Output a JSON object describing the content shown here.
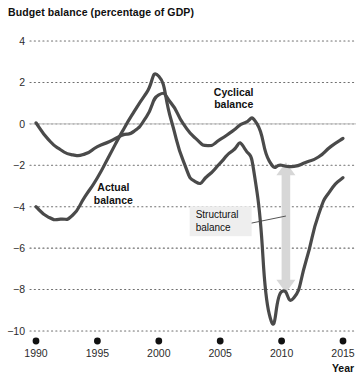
{
  "chart_data": {
    "type": "line",
    "title": "Budget balance (percentage of GDP)",
    "xlabel": "Year",
    "ylabel": "",
    "xlim": [
      1989,
      2015.6
    ],
    "ylim": [
      -10,
      4
    ],
    "grid": "horizontal-dotted",
    "zero_line": true,
    "legend_position": "inline-annotations",
    "xticks": [
      1990,
      1995,
      2000,
      2005,
      2010,
      2015
    ],
    "xtick_labels": [
      "1990",
      "1995",
      "2000",
      "2005",
      "2010",
      "2015"
    ],
    "yticks": [
      4,
      2,
      0,
      -2,
      -4,
      -6,
      -8,
      -10
    ],
    "ytick_labels": [
      "4",
      "2",
      "0",
      "−2",
      "−4",
      "−6",
      "−8",
      "−10"
    ],
    "series": [
      {
        "name": "Cyclical balance",
        "color": "#4a4a4a",
        "label_x": 2006.1,
        "label_y": 1.35,
        "x": [
          1990,
          1991,
          1992,
          1993,
          1994,
          1995,
          1996,
          1997,
          1998,
          1999,
          2000,
          2001,
          2002,
          2003,
          2004,
          2005,
          2006,
          2007,
          2008,
          2009,
          2010,
          2011,
          2012,
          2013,
          2014,
          2015
        ],
        "values": [
          0.05,
          -0.75,
          -1.25,
          -1.5,
          -1.45,
          -1.1,
          -0.85,
          -0.55,
          -0.35,
          0.35,
          1.4,
          1.0,
          0.0,
          -0.7,
          -1.05,
          -0.75,
          -0.35,
          0.05,
          0.0,
          -1.8,
          -2.0,
          -2.05,
          -1.85,
          -1.6,
          -1.1,
          -0.7
        ]
      },
      {
        "name": "Actual balance",
        "color": "#4a4a4a",
        "label_x": 1996.3,
        "label_y": -3.25,
        "x": [
          1990,
          1991,
          1992,
          1993,
          1994,
          1995,
          1996,
          1997,
          1998,
          1999,
          2000,
          2001,
          2002,
          2003,
          2004,
          2005,
          2006,
          2007,
          2008,
          2009,
          2010,
          2011,
          2012,
          2013,
          2014,
          2015
        ],
        "values": [
          -4.0,
          -4.5,
          -4.6,
          -4.4,
          -3.5,
          -2.6,
          -1.5,
          -0.4,
          0.6,
          1.5,
          2.3,
          0.2,
          -1.8,
          -2.8,
          -2.5,
          -1.9,
          -1.3,
          -1.2,
          -3.3,
          -9.2,
          -8.1,
          -8.4,
          -6.6,
          -4.4,
          -3.2,
          -2.6
        ]
      }
    ],
    "annotations": [
      {
        "name": "structural-balance-callout",
        "text_line1": "Structural",
        "text_line2": "balance",
        "box_x": 2003.0,
        "box_y": -4.7,
        "leader_from_x": 2005.0,
        "leader_from_y": -5.1,
        "leader_to_x": 2010.35,
        "leader_to_y": -4.45
      },
      {
        "name": "structural-gap-arrow",
        "type": "double-headed-arrow",
        "color": "#d7d7d7",
        "x": 2010.35,
        "y_top": -1.85,
        "y_bottom": -8.15
      }
    ]
  }
}
